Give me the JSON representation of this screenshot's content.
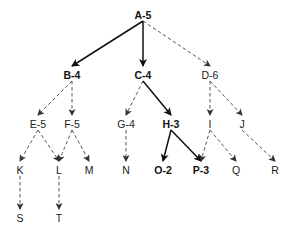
{
  "diagram": {
    "type": "search-tree",
    "nodes": [
      {
        "id": "A",
        "label": "A-5",
        "x": 143,
        "y": 15,
        "bold": true
      },
      {
        "id": "B",
        "label": "B-4",
        "x": 72,
        "y": 75,
        "bold": true
      },
      {
        "id": "C",
        "label": "C-4",
        "x": 143,
        "y": 75,
        "bold": true
      },
      {
        "id": "D",
        "label": "D-6",
        "x": 210,
        "y": 75,
        "bold": false
      },
      {
        "id": "E",
        "label": "E-5",
        "x": 38,
        "y": 124,
        "bold": false
      },
      {
        "id": "F",
        "label": "F-5",
        "x": 72,
        "y": 124,
        "bold": false
      },
      {
        "id": "G",
        "label": "G-4",
        "x": 126,
        "y": 124,
        "bold": false
      },
      {
        "id": "H",
        "label": "H-3",
        "x": 171,
        "y": 124,
        "bold": true
      },
      {
        "id": "I",
        "label": "I",
        "x": 210,
        "y": 124,
        "bold": false
      },
      {
        "id": "J",
        "label": "J",
        "x": 242,
        "y": 124,
        "bold": false
      },
      {
        "id": "K",
        "label": "K",
        "x": 20,
        "y": 170,
        "bold": false
      },
      {
        "id": "L",
        "label": "L",
        "x": 59,
        "y": 170,
        "bold": false
      },
      {
        "id": "M",
        "label": "M",
        "x": 89,
        "y": 170,
        "bold": false
      },
      {
        "id": "N",
        "label": "N",
        "x": 126,
        "y": 170,
        "bold": false
      },
      {
        "id": "O",
        "label": "O-2",
        "x": 163,
        "y": 170,
        "bold": true
      },
      {
        "id": "P",
        "label": "P-3",
        "x": 201,
        "y": 170,
        "bold": true
      },
      {
        "id": "Q",
        "label": "Q",
        "x": 236,
        "y": 170,
        "bold": false
      },
      {
        "id": "R",
        "label": "R",
        "x": 275,
        "y": 170,
        "bold": false
      },
      {
        "id": "S",
        "label": "S",
        "x": 20,
        "y": 218,
        "bold": false
      },
      {
        "id": "T",
        "label": "T",
        "x": 59,
        "y": 218,
        "bold": false
      }
    ],
    "edges": [
      {
        "from": "A",
        "to": "B",
        "style": "solid"
      },
      {
        "from": "A",
        "to": "C",
        "style": "solid"
      },
      {
        "from": "A",
        "to": "D",
        "style": "dashed"
      },
      {
        "from": "B",
        "to": "E",
        "style": "dashed"
      },
      {
        "from": "B",
        "to": "F",
        "style": "dashed"
      },
      {
        "from": "C",
        "to": "G",
        "style": "dashed"
      },
      {
        "from": "C",
        "to": "H",
        "style": "solid"
      },
      {
        "from": "D",
        "to": "I",
        "style": "dashed"
      },
      {
        "from": "D",
        "to": "J",
        "style": "dashed"
      },
      {
        "from": "E",
        "to": "K",
        "style": "dashed"
      },
      {
        "from": "E",
        "to": "L",
        "style": "dashed"
      },
      {
        "from": "F",
        "to": "L",
        "style": "dashed"
      },
      {
        "from": "F",
        "to": "M",
        "style": "dashed"
      },
      {
        "from": "G",
        "to": "N",
        "style": "dashed"
      },
      {
        "from": "H",
        "to": "O",
        "style": "solid"
      },
      {
        "from": "H",
        "to": "P",
        "style": "solid"
      },
      {
        "from": "I",
        "to": "P",
        "style": "dashed"
      },
      {
        "from": "I",
        "to": "Q",
        "style": "dashed"
      },
      {
        "from": "J",
        "to": "R",
        "style": "dashed"
      },
      {
        "from": "K",
        "to": "S",
        "style": "dashed"
      },
      {
        "from": "L",
        "to": "T",
        "style": "dashed"
      }
    ]
  }
}
